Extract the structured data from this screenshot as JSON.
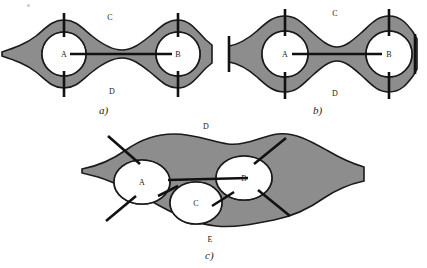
{
  "figure": {
    "title": "",
    "panels": [
      {
        "id": "a",
        "caption": "a)",
        "holes": [
          {
            "label": "A"
          },
          {
            "label": "B"
          }
        ],
        "regions": [
          {
            "label": "C",
            "position": "top"
          },
          {
            "label": "D",
            "position": "bottom"
          }
        ],
        "ends": "open"
      },
      {
        "id": "b",
        "caption": "b)",
        "holes": [
          {
            "label": "A"
          },
          {
            "label": "B"
          }
        ],
        "regions": [
          {
            "label": "C",
            "position": "top"
          },
          {
            "label": "D",
            "position": "bottom"
          }
        ],
        "ends": "capped"
      },
      {
        "id": "c",
        "caption": "c)",
        "holes": [
          {
            "label": "A"
          },
          {
            "label": "B"
          },
          {
            "label": "C"
          }
        ],
        "regions": [
          {
            "label": "D",
            "position": "top"
          },
          {
            "label": "E",
            "position": "bottom"
          }
        ],
        "ends": "open"
      }
    ],
    "colors": {
      "band_fill": "#8d8d8d",
      "hole_fill": "#ffffff",
      "outline": "#1a1a1a",
      "edge": "#111111",
      "background": "#ffffff"
    }
  }
}
